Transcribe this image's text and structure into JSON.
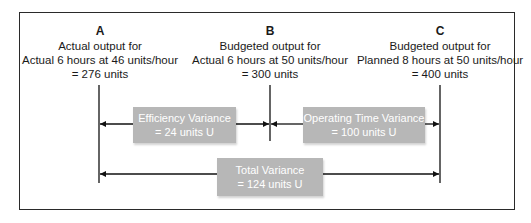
{
  "points": [
    {
      "letter": "A",
      "line1": "Actual output for",
      "line2": "Actual 6 hours at 46 units/hour",
      "line3": "= 276 units"
    },
    {
      "letter": "B",
      "line1": "Budgeted output for",
      "line2": "Actual 6 hours at 50 units/hour",
      "line3": "= 300 units"
    },
    {
      "letter": "C",
      "line1": "Budgeted output for",
      "line2": "Planned 8 hours at 50 units/hour",
      "line3": "= 400 units"
    }
  ],
  "variances": {
    "efficiency": {
      "title": "Efficiency Variance",
      "value": "= 24 units U"
    },
    "operating_time": {
      "title": "Operating Time Variance",
      "value": "= 100 units U"
    },
    "total": {
      "title": "Total Variance",
      "value": "= 124 units U"
    }
  },
  "colors": {
    "box": "#b7b7b7",
    "line": "#111111"
  }
}
